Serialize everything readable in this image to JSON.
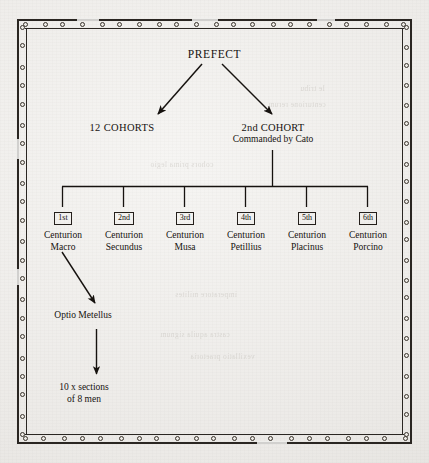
{
  "document": {
    "kind": "scanned-book-page",
    "figure_type": "organisational-hierarchy-chart",
    "paper_color": "#efeeec",
    "ink_color": "#16120f"
  },
  "frame": {
    "style": "double-rule-with-eyelets",
    "eyelet_count_top": 21,
    "eyelet_count_side": 22
  },
  "chart_data": {
    "type": "diagram",
    "title": "PREFECT",
    "subtype": "tree",
    "nodes": [
      {
        "id": "prefect",
        "label": "PREFECT",
        "level": 0
      },
      {
        "id": "12-cohorts",
        "label": "12 COHORTS",
        "level": 1
      },
      {
        "id": "2nd-cohort",
        "label": "2nd COHORT",
        "sublabel": "Commanded by Cato",
        "level": 1
      },
      {
        "id": "cent-1",
        "rank": "1st",
        "label": "Centurion",
        "name": "Macro",
        "level": 2
      },
      {
        "id": "cent-2",
        "rank": "2nd",
        "label": "Centurion",
        "name": "Secundus",
        "level": 2
      },
      {
        "id": "cent-3",
        "rank": "3rd",
        "label": "Centurion",
        "name": "Musa",
        "level": 2
      },
      {
        "id": "cent-4",
        "rank": "4th",
        "label": "Centurion",
        "name": "Petillius",
        "level": 2
      },
      {
        "id": "cent-5",
        "rank": "5th",
        "label": "Centurion",
        "name": "Placinus",
        "level": 2
      },
      {
        "id": "cent-6",
        "rank": "6th",
        "label": "Centurion",
        "name": "Porcino",
        "level": 2
      },
      {
        "id": "optio",
        "label": "Optio Metellus",
        "level": 3
      },
      {
        "id": "sections",
        "label": "10 x sections",
        "sublabel": "of 8 men",
        "level": 4
      }
    ],
    "edges": [
      {
        "from": "prefect",
        "to": "12-cohorts",
        "style": "arrow"
      },
      {
        "from": "prefect",
        "to": "2nd-cohort",
        "style": "arrow"
      },
      {
        "from": "2nd-cohort",
        "to": "cent-1",
        "style": "elbow"
      },
      {
        "from": "2nd-cohort",
        "to": "cent-2",
        "style": "elbow"
      },
      {
        "from": "2nd-cohort",
        "to": "cent-3",
        "style": "elbow"
      },
      {
        "from": "2nd-cohort",
        "to": "cent-4",
        "style": "elbow"
      },
      {
        "from": "2nd-cohort",
        "to": "cent-5",
        "style": "elbow"
      },
      {
        "from": "2nd-cohort",
        "to": "cent-6",
        "style": "elbow"
      },
      {
        "from": "cent-1",
        "to": "optio",
        "style": "arrow"
      },
      {
        "from": "optio",
        "to": "sections",
        "style": "arrow"
      }
    ]
  },
  "prefect": {
    "label": "PREFECT"
  },
  "cohorts": {
    "left": {
      "label": "12 COHORTS"
    },
    "right": {
      "label": "2nd COHORT",
      "commander": "Commanded by Cato"
    }
  },
  "centurions": [
    {
      "rank": "1st",
      "title": "Centurion",
      "name": "Macro"
    },
    {
      "rank": "2nd",
      "title": "Centurion",
      "name": "Secundus"
    },
    {
      "rank": "3rd",
      "title": "Centurion",
      "name": "Musa"
    },
    {
      "rank": "4th",
      "title": "Centurion",
      "name": "Petillius"
    },
    {
      "rank": "5th",
      "title": "Centurion",
      "name": "Placinus"
    },
    {
      "rank": "6th",
      "title": "Centurion",
      "name": "Porcino"
    }
  ],
  "optio": {
    "label": "Optio Metellus"
  },
  "sections": {
    "line1": "10 x sections",
    "line2": "of 8 men"
  },
  "bleed_through": [
    {
      "text": "le tribu"
    },
    {
      "text": "centurione rerum"
    },
    {
      "text": "cohors prima legio"
    },
    {
      "text": "imperatore milites"
    },
    {
      "text": "castra aquila signum"
    },
    {
      "text": "vexillatio praetoria"
    }
  ]
}
